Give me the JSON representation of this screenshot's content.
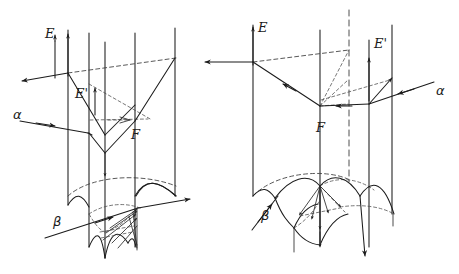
{
  "figure": {
    "kind": "hand-drawn geometric ray diagram",
    "background_color": "#ffffff",
    "ink_color": "#1b1b1b",
    "dashed_ink_color": "#3a3a3a",
    "panel_count": 2,
    "canvas": {
      "width": 459,
      "height": 274
    }
  },
  "panels": [
    {
      "id": "left-panel",
      "name": "left-diagram",
      "labels": {
        "E": "E",
        "E_prime": "E'",
        "alpha": "α",
        "beta": "β",
        "F": "F"
      },
      "label_positions": {
        "E": {
          "x": 47,
          "y": 34
        },
        "E_prime": {
          "x": 77,
          "y": 94
        },
        "alpha": {
          "x": 15,
          "y": 114
        },
        "beta": {
          "x": 55,
          "y": 222
        },
        "F": {
          "x": 133,
          "y": 135
        }
      },
      "vertical_lines_x": [
        68,
        89,
        105,
        135,
        175
      ],
      "rays": [
        {
          "name": "alpha-incoming",
          "label": "α",
          "direction": "rightward-down",
          "arrow": "right"
        },
        {
          "name": "E-outgoing",
          "label": "E",
          "direction": "leftward-up",
          "arrow": "left"
        },
        {
          "name": "E-prime-internal",
          "label": "E'",
          "direction": "upward",
          "arrow": "up"
        },
        {
          "name": "beta-incoming",
          "label": "β",
          "direction": "rightward-up",
          "arrow": "right"
        }
      ]
    },
    {
      "id": "right-panel",
      "name": "right-diagram",
      "labels": {
        "E": "E",
        "E_prime": "E'",
        "alpha": "α",
        "beta": "β",
        "F": "F"
      },
      "label_positions": {
        "E": {
          "x": 258,
          "y": 27
        },
        "E_prime": {
          "x": 375,
          "y": 43
        },
        "alpha": {
          "x": 425,
          "y": 88
        },
        "beta": {
          "x": 263,
          "y": 215
        },
        "F": {
          "x": 318,
          "y": 128
        }
      },
      "vertical_lines_x": [
        253,
        320,
        369,
        392
      ],
      "rays": [
        {
          "name": "alpha-incoming",
          "label": "α",
          "direction": "leftward-down",
          "arrow": "left"
        },
        {
          "name": "E-outgoing",
          "label": "E",
          "direction": "leftward",
          "arrow": "left"
        },
        {
          "name": "E-prime-internal",
          "label": "E'",
          "direction": "upward",
          "arrow": "up"
        },
        {
          "name": "beta-incoming",
          "label": "β",
          "direction": "rightward-up",
          "arrow": "right"
        }
      ]
    }
  ]
}
